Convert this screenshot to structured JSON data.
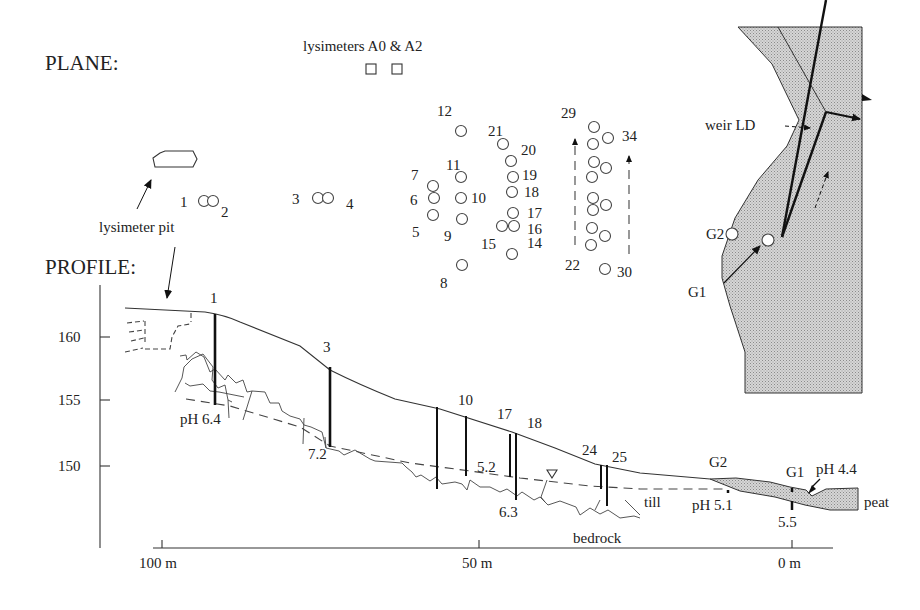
{
  "headings": {
    "plane": "PLANE:",
    "profile": "PROFILE:"
  },
  "plane": {
    "lysimeters_label": "lysimeters A0 & A2",
    "lysimeter_pit_label": "lysimeter pit",
    "weir_label": "weir LD",
    "wells": [
      {
        "id": "1",
        "x": 204,
        "y": 201
      },
      {
        "id": "2",
        "x": 213,
        "y": 201
      },
      {
        "id": "3",
        "x": 318,
        "y": 198
      },
      {
        "id": "4",
        "x": 328,
        "y": 198
      },
      {
        "id": "5",
        "x": 433,
        "y": 215
      },
      {
        "id": "6",
        "x": 434,
        "y": 198
      },
      {
        "id": "7",
        "x": 433,
        "y": 186
      },
      {
        "id": "8",
        "x": 462,
        "y": 265
      },
      {
        "id": "9",
        "x": 462,
        "y": 219
      },
      {
        "id": "10",
        "x": 461,
        "y": 198
      },
      {
        "id": "11",
        "x": 461,
        "y": 177
      },
      {
        "id": "12",
        "x": 461,
        "y": 131
      },
      {
        "id": "14",
        "x": 512,
        "y": 254
      },
      {
        "id": "15",
        "x": 502,
        "y": 226
      },
      {
        "id": "16",
        "x": 514,
        "y": 226
      },
      {
        "id": "17",
        "x": 513,
        "y": 213
      },
      {
        "id": "18",
        "x": 512,
        "y": 192
      },
      {
        "id": "19",
        "x": 513,
        "y": 177
      },
      {
        "id": "20",
        "x": 511,
        "y": 161
      },
      {
        "id": "21",
        "x": 503,
        "y": 144
      },
      {
        "id": "22",
        "x": 591,
        "y": 245
      },
      {
        "id": "23",
        "x": 605,
        "y": 236
      },
      {
        "id": "24",
        "x": 592,
        "y": 228
      },
      {
        "id": "25",
        "x": 593,
        "y": 210
      },
      {
        "id": "26",
        "x": 606,
        "y": 205
      },
      {
        "id": "27",
        "x": 593,
        "y": 198
      },
      {
        "id": "28",
        "x": 592,
        "y": 177
      },
      {
        "id": "29",
        "x": 594,
        "y": 162
      },
      {
        "id": "30",
        "x": 605,
        "y": 269
      },
      {
        "id": "31",
        "x": 606,
        "y": 168
      },
      {
        "id": "32",
        "x": 593,
        "y": 144
      },
      {
        "id": "33",
        "x": 608,
        "y": 138
      },
      {
        "id": "34",
        "x": 594,
        "y": 127
      }
    ],
    "well_labels": [
      {
        "text": "1",
        "x": 180,
        "y": 207
      },
      {
        "text": "2",
        "x": 221,
        "y": 217
      },
      {
        "text": "3",
        "x": 292,
        "y": 204
      },
      {
        "text": "4",
        "x": 346,
        "y": 209
      },
      {
        "text": "5",
        "x": 412,
        "y": 237
      },
      {
        "text": "6",
        "x": 410,
        "y": 205
      },
      {
        "text": "7",
        "x": 411,
        "y": 180
      },
      {
        "text": "8",
        "x": 440,
        "y": 288
      },
      {
        "text": "9",
        "x": 444,
        "y": 241
      },
      {
        "text": "10",
        "x": 471,
        "y": 203
      },
      {
        "text": "11",
        "x": 446,
        "y": 170
      },
      {
        "text": "12",
        "x": 437,
        "y": 116
      },
      {
        "text": "14",
        "x": 527,
        "y": 248
      },
      {
        "text": "15",
        "x": 481,
        "y": 249
      },
      {
        "text": "16",
        "x": 527,
        "y": 234
      },
      {
        "text": "17",
        "x": 527,
        "y": 218
      },
      {
        "text": "18",
        "x": 524,
        "y": 197
      },
      {
        "text": "19",
        "x": 522,
        "y": 180
      },
      {
        "text": "20",
        "x": 521,
        "y": 155
      },
      {
        "text": "21",
        "x": 488,
        "y": 136
      },
      {
        "text": "22",
        "x": 565,
        "y": 270
      },
      {
        "text": "29",
        "x": 561,
        "y": 118
      },
      {
        "text": "30",
        "x": 617,
        "y": 277
      },
      {
        "text": "34",
        "x": 622,
        "y": 141
      }
    ],
    "gauges": [
      {
        "id": "G1",
        "label": "G1",
        "x": 768,
        "y": 240
      },
      {
        "id": "G2",
        "label": "G2",
        "x": 732,
        "y": 234
      }
    ]
  },
  "profile": {
    "y_axis": {
      "ticks": [
        {
          "label": "160",
          "value": 160
        },
        {
          "label": "155",
          "value": 155
        },
        {
          "label": "150",
          "value": 150
        }
      ]
    },
    "x_axis": {
      "ticks": [
        {
          "label": "100 m",
          "value": 100
        },
        {
          "label": "50 m",
          "value": 50
        },
        {
          "label": "0 m",
          "value": 0
        }
      ]
    },
    "piezometers": [
      {
        "label": "1",
        "lx": 210,
        "ly": 303
      },
      {
        "label": "3",
        "lx": 323,
        "ly": 352
      },
      {
        "label": "10",
        "lx": 458,
        "ly": 405
      },
      {
        "label": "17",
        "lx": 497,
        "ly": 419
      },
      {
        "label": "18",
        "lx": 527,
        "ly": 428
      },
      {
        "label": "24",
        "lx": 582,
        "ly": 455
      },
      {
        "label": "25",
        "lx": 612,
        "ly": 462
      },
      {
        "label": "G2",
        "lx": 709,
        "ly": 467
      },
      {
        "label": "G1",
        "lx": 786,
        "ly": 477
      }
    ],
    "ph_values": [
      {
        "text": "pH 6.4",
        "x": 180,
        "y": 424
      },
      {
        "text": "7.2",
        "x": 308,
        "y": 459
      },
      {
        "text": "5.2",
        "x": 477,
        "y": 472
      },
      {
        "text": "6.3",
        "x": 499,
        "y": 517
      },
      {
        "text": "pH 5.1",
        "x": 692,
        "y": 510
      },
      {
        "text": "5.5",
        "x": 778,
        "y": 527
      },
      {
        "text": "pH 4.4",
        "x": 816,
        "y": 474
      }
    ],
    "material_labels": {
      "till": "till",
      "bedrock": "bedrock",
      "peat": "peat"
    }
  }
}
